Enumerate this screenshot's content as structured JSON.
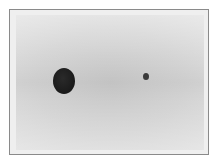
{
  "image": {
    "description": "Grayscale photograph in a thin frame showing a large dark circular dot on the left and a small dark dot on the right against a light gray background",
    "background_color": "#d2d2d2",
    "frame_color": "#8a8a8a",
    "objects": [
      {
        "name": "large-dot",
        "cx": 64,
        "cy": 81,
        "rx": 11,
        "ry": 13,
        "color": "#1e1e1e"
      },
      {
        "name": "small-dot",
        "cx": 146,
        "cy": 77,
        "rx": 3,
        "ry": 3.5,
        "color": "#3a3a3a"
      }
    ]
  }
}
